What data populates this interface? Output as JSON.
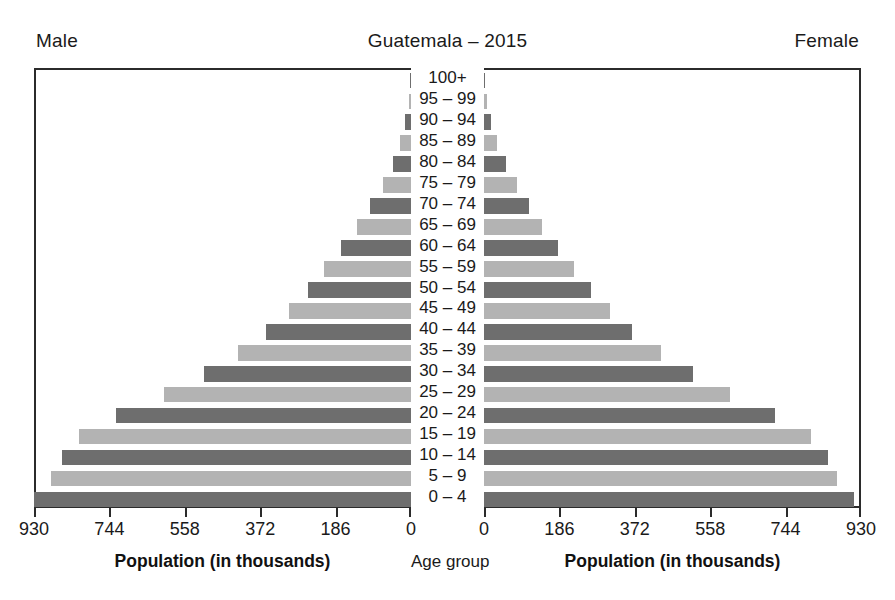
{
  "header": {
    "male_label": "Male",
    "title": "Guatemala – 2015",
    "female_label": "Female"
  },
  "captions": {
    "left_axis_title": "Population (in thousands)",
    "center_axis_title": "Age group",
    "right_axis_title": "Population (in thousands)"
  },
  "chart_data": {
    "type": "bar",
    "subtype": "population-pyramid",
    "title": "Guatemala – 2015",
    "xlabel": "Population (in thousands)",
    "ylabel": "Age group",
    "units": "thousands",
    "xlim": [
      0,
      930
    ],
    "grid": false,
    "legend": [
      "Male",
      "Female"
    ],
    "legend_position": "top-corners",
    "left_ticks": [
      930,
      744,
      558,
      372,
      186,
      0
    ],
    "right_ticks": [
      0,
      186,
      372,
      558,
      744,
      930
    ],
    "categories": [
      "100+",
      "95 – 99",
      "90 – 94",
      "85 – 89",
      "80 – 84",
      "75 – 79",
      "70 – 74",
      "65 – 69",
      "60 – 64",
      "55 – 59",
      "50 – 54",
      "45 – 49",
      "40 – 44",
      "35 – 39",
      "30 – 34",
      "25 – 29",
      "20 – 24",
      "15 – 19",
      "10 – 14",
      "5 – 9",
      "0 – 4"
    ],
    "series": [
      {
        "name": "Male",
        "side": "left",
        "values": [
          2,
          6,
          14,
          26,
          45,
          70,
          102,
          133,
          172,
          214,
          253,
          302,
          358,
          428,
          511,
          610,
          728,
          820,
          862,
          888,
          930
        ]
      },
      {
        "name": "Female",
        "side": "right",
        "values": [
          3,
          8,
          18,
          33,
          55,
          82,
          112,
          143,
          182,
          223,
          263,
          312,
          366,
          436,
          515,
          608,
          718,
          806,
          848,
          872,
          912
        ]
      }
    ],
    "colors": {
      "bar_dark": "#6e6e6e",
      "bar_light": "#b3b3b3",
      "axis": "#2b2b2b",
      "text": "#1a1a1a",
      "background": "#ffffff"
    }
  }
}
